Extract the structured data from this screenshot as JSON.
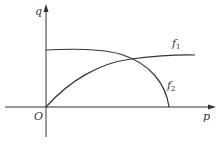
{
  "diagram": {
    "axes": {
      "x_label": "p",
      "y_label": "q",
      "origin_label": "O"
    },
    "curves": [
      {
        "name": "f",
        "subscript": "1",
        "description": "increasing concave curve from origin"
      },
      {
        "name": "f",
        "subscript": "2",
        "description": "decreasing concave curve from q-axis to p-axis"
      }
    ],
    "colors": {
      "line": "#333333",
      "background": "#ffffff"
    }
  }
}
